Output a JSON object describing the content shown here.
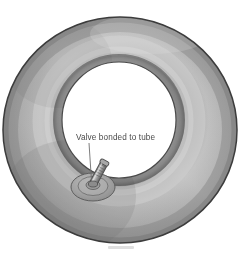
{
  "figure": {
    "background_color": "#ffffff"
  },
  "annotations": [
    {
      "id": "valve-label",
      "text": "Valve bonded to tube",
      "text_color": "#4a4a4a",
      "text_x": 76,
      "text_y": 140,
      "leader_from": [
        89,
        143
      ],
      "leader_to": [
        91,
        181
      ],
      "leader_color": "#6e6e6e"
    }
  ],
  "tube": {
    "label": "inner tube body",
    "outer_ellipse": {
      "cx": 120,
      "cy": 130,
      "rx": 117,
      "ry": 113
    },
    "inner_ellipse": {
      "cx": 119,
      "cy": 120,
      "rx": 57,
      "ry": 58
    },
    "fill_color": "#9d9d9d",
    "highlight_color": "#c2c2c2",
    "shadow_color": "#7b7b7b",
    "outline_color": "#3a3a3a",
    "hole_fill": "#ffffff"
  },
  "valve": {
    "label": "valve bonded to tube",
    "base_plate": {
      "cx": 93,
      "cy": 186,
      "rx": 22,
      "ry": 14
    },
    "stem_color": "#8f8f8f",
    "stem_highlight": "#c8c8c8",
    "stem_outline": "#4a4a4a",
    "base_fill": "#a8a8a8",
    "angle_degrees": 28
  },
  "caption_fragment": {
    "visible": true,
    "text": ""
  }
}
